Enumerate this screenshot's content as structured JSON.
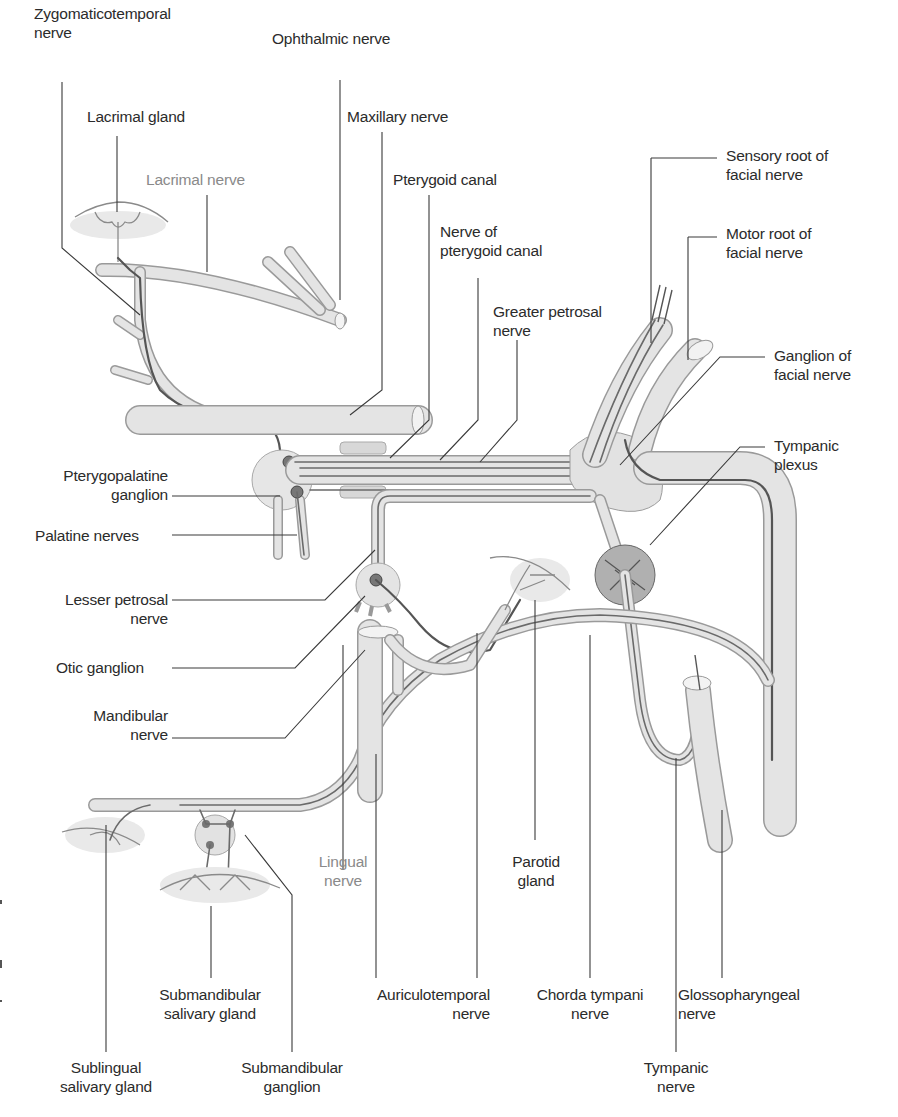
{
  "figure": {
    "type": "anatomical-diagram",
    "colors": {
      "background": "#ffffff",
      "nerve_fill": "#e4e4e4",
      "nerve_outline": "#9a9a9a",
      "fiber": "#555555",
      "label_text": "#2b2b2b",
      "label_text_light": "#8a8a8a",
      "leader_line": "#3a3a3a"
    }
  },
  "labels": {
    "zygomaticotemporal": "Zygomaticotemporal\nnerve",
    "ophthalmic": "Ophthalmic nerve",
    "lacrimal_gland": "Lacrimal gland",
    "maxillary": "Maxillary nerve",
    "lacrimal_nerve": "Lacrimal nerve",
    "pterygoid_canal": "Pterygoid canal",
    "nerve_pterygoid_canal": "Nerve of\npterygoid canal",
    "greater_petrosal": "Greater petrosal\nnerve",
    "sensory_root": "Sensory root of\nfacial nerve",
    "motor_root": "Motor root of\nfacial nerve",
    "ganglion_facial": "Ganglion of\nfacial nerve",
    "tympanic_plexus": "Tympanic\nplexus",
    "pterygopalatine": "Pterygopalatine\nganglion",
    "palatine": "Palatine nerves",
    "lesser_petrosal": "Lesser petrosal\nnerve",
    "otic": "Otic ganglion",
    "mandibular": "Mandibular\nnerve",
    "lingual": "Lingual\nnerve",
    "parotid": "Parotid\ngland",
    "submandibular_gland": "Submandibular\nsalivary gland",
    "auriculotemporal": "Auriculotemporal\nnerve",
    "chorda_tympani": "Chorda tympani\nnerve",
    "glossopharyngeal": "Glossopharyngeal\nnerve",
    "sublingual": "Sublingual\nsalivary gland",
    "submandibular_ganglion": "Submandibular\nganglion",
    "tympanic_nerve": "Tympanic\nnerve"
  }
}
